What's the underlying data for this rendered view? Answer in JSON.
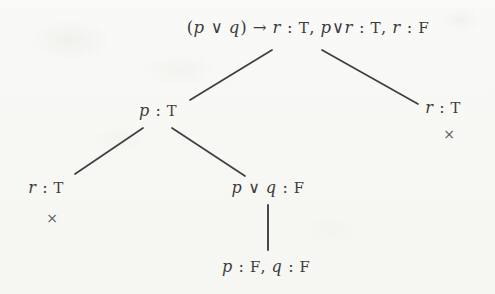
{
  "figure": {
    "type": "proof-tree",
    "background_color": "#f8f8f6",
    "ink_color": "#3c3c3c",
    "marker_color": "#5e5e5e"
  },
  "nodes": {
    "root": {
      "id": "root",
      "text": "(p ∨ q) → r : T, p ∨ r : T, r : F",
      "parts": [
        {
          "t": "(",
          "k": "op"
        },
        {
          "t": "p",
          "k": "mv"
        },
        {
          "t": " ∨ ",
          "k": "op"
        },
        {
          "t": "q",
          "k": "mv"
        },
        {
          "t": ") → ",
          "k": "op"
        },
        {
          "t": "r",
          "k": "mv"
        },
        {
          "t": " : ",
          "k": "op"
        },
        {
          "t": "T",
          "k": "tv"
        },
        {
          "t": ", ",
          "k": "op"
        },
        {
          "t": "p",
          "k": "mv"
        },
        {
          "t": "∨",
          "k": "op"
        },
        {
          "t": "r",
          "k": "mv"
        },
        {
          "t": " : ",
          "k": "op"
        },
        {
          "t": "T",
          "k": "tv"
        },
        {
          "t": ", ",
          "k": "op"
        },
        {
          "t": "r",
          "k": "mv"
        },
        {
          "t": " : ",
          "k": "op"
        },
        {
          "t": "F",
          "k": "tv"
        }
      ]
    },
    "p_true": {
      "id": "p-true",
      "text": "p : T",
      "parts": [
        {
          "t": "p",
          "k": "mv"
        },
        {
          "t": " : ",
          "k": "op"
        },
        {
          "t": "T",
          "k": "tv"
        }
      ]
    },
    "r_true_right": {
      "id": "r-true-right",
      "text": "r : T",
      "parts": [
        {
          "t": "r",
          "k": "mv"
        },
        {
          "t": " : ",
          "k": "op"
        },
        {
          "t": "T",
          "k": "tv"
        }
      ]
    },
    "r_true_left": {
      "id": "r-true-left",
      "text": "r : T",
      "parts": [
        {
          "t": "r",
          "k": "mv"
        },
        {
          "t": " : ",
          "k": "op"
        },
        {
          "t": "T",
          "k": "tv"
        }
      ]
    },
    "p_or_q_false": {
      "id": "p-or-q-false",
      "text": "p ∨ q : F",
      "parts": [
        {
          "t": "p",
          "k": "mv"
        },
        {
          "t": " ∨ ",
          "k": "op"
        },
        {
          "t": "q",
          "k": "mv"
        },
        {
          "t": " : ",
          "k": "op"
        },
        {
          "t": "F",
          "k": "tv"
        }
      ]
    },
    "p_false_q_false": {
      "id": "p-false-q-false",
      "text": "p : F, q : F",
      "parts": [
        {
          "t": "p",
          "k": "mv"
        },
        {
          "t": " : ",
          "k": "op"
        },
        {
          "t": "F",
          "k": "tv"
        },
        {
          "t": ", ",
          "k": "op"
        },
        {
          "t": "q",
          "k": "mv"
        },
        {
          "t": " : ",
          "k": "op"
        },
        {
          "t": "F",
          "k": "tv"
        }
      ]
    }
  },
  "markers": {
    "closed_right": {
      "symbol": "×",
      "meaning": "closed-branch"
    },
    "closed_left": {
      "symbol": "×",
      "meaning": "closed-branch"
    }
  },
  "edges": [
    {
      "from": "root",
      "to": "p_true",
      "x1": 272,
      "y1": 50,
      "x2": 190,
      "y2": 100
    },
    {
      "from": "root",
      "to": "r_true_right",
      "x1": 322,
      "y1": 50,
      "x2": 418,
      "y2": 104
    },
    {
      "from": "p_true",
      "to": "r_true_left",
      "x1": 143,
      "y1": 128,
      "x2": 75,
      "y2": 174
    },
    {
      "from": "p_true",
      "to": "p_or_q_false",
      "x1": 172,
      "y1": 128,
      "x2": 245,
      "y2": 176
    },
    {
      "from": "p_or_q_false",
      "to": "p_false_q_false",
      "x1": 268,
      "y1": 205,
      "x2": 268,
      "y2": 250
    }
  ]
}
